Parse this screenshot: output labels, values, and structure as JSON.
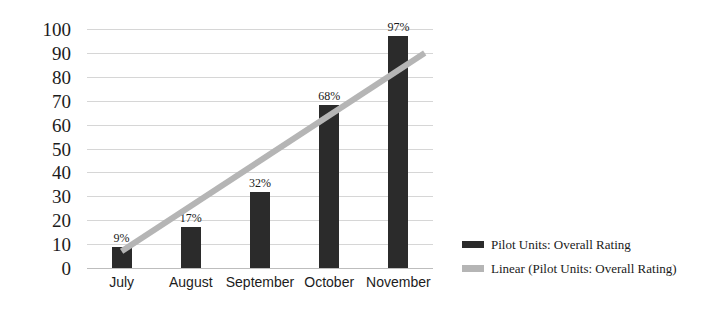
{
  "chart_data": {
    "type": "bar",
    "title": "",
    "xlabel": "",
    "ylabel": "",
    "categories": [
      "July",
      "August",
      "September",
      "October",
      "November"
    ],
    "values": [
      9,
      17,
      32,
      68,
      97
    ],
    "data_labels": [
      "9%",
      "17%",
      "32%",
      "68%",
      "97%"
    ],
    "ylim": [
      0,
      100
    ],
    "ytick_step": 10,
    "ytick_labels": [
      "100",
      "90",
      "80",
      "70",
      "60",
      "50",
      "40",
      "30",
      "20",
      "10",
      "0"
    ],
    "grid": true,
    "legend_position": "right",
    "series": [
      {
        "name": "Pilot Units: Overall Rating",
        "type": "bar",
        "color": "#2b2b2b",
        "values": [
          9,
          17,
          32,
          68,
          97
        ]
      },
      {
        "name": "Linear (Pilot Units: Overall Rating)",
        "type": "line",
        "color": "#b5b5b5",
        "trendline_start_value": 7,
        "trendline_end_value": 90
      }
    ]
  },
  "axes": {
    "y_ticks": [
      {
        "label": "100",
        "value": 100
      },
      {
        "label": "90",
        "value": 90
      },
      {
        "label": "80",
        "value": 80
      },
      {
        "label": "70",
        "value": 70
      },
      {
        "label": "60",
        "value": 60
      },
      {
        "label": "50",
        "value": 50
      },
      {
        "label": "40",
        "value": 40
      },
      {
        "label": "30",
        "value": 30
      },
      {
        "label": "20",
        "value": 20
      },
      {
        "label": "10",
        "value": 10
      },
      {
        "label": "0",
        "value": 0
      }
    ],
    "x_ticks": [
      {
        "label": "July"
      },
      {
        "label": "August"
      },
      {
        "label": "September"
      },
      {
        "label": "October"
      },
      {
        "label": "November"
      }
    ]
  },
  "bars": [
    {
      "category": "July",
      "value": 9,
      "label": "9%"
    },
    {
      "category": "August",
      "value": 17,
      "label": "17%"
    },
    {
      "category": "September",
      "value": 32,
      "label": "32%"
    },
    {
      "category": "October",
      "value": 68,
      "label": "68%"
    },
    {
      "category": "November",
      "value": 97,
      "label": "97%"
    }
  ],
  "legend": {
    "items": [
      {
        "label": "Pilot Units: Overall Rating",
        "color": "#2b2b2b",
        "swatch": "bar-swatch"
      },
      {
        "label": "Linear (Pilot Units: Overall Rating)",
        "color": "#b5b5b5",
        "swatch": "line-swatch"
      }
    ]
  },
  "colors": {
    "bar": "#2b2b2b",
    "trendline": "#b5b5b5",
    "gridline": "#d6d6d6",
    "text": "#1c1c1c",
    "background": "#ffffff"
  }
}
